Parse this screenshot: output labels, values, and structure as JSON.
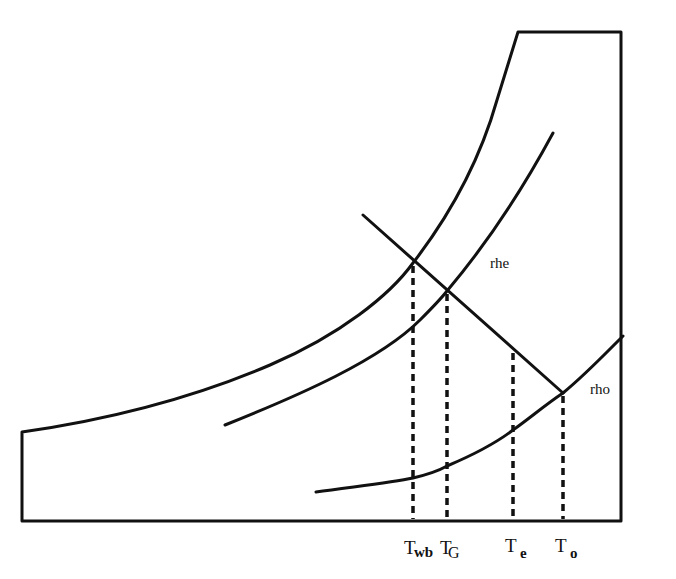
{
  "diagram": {
    "type": "psychrometric-sketch",
    "stroke_color": "#111111",
    "background": "#ffffff",
    "curve_labels": {
      "rhe": "rhe",
      "rho": "rho"
    },
    "axis_labels": [
      {
        "main": "T",
        "sub": "wb",
        "x": 413
      },
      {
        "main": "T",
        "sub": "G",
        "x": 447
      },
      {
        "main": "T",
        "sub": "e",
        "x": 513
      },
      {
        "main": "T",
        "sub": "o",
        "x": 563
      }
    ]
  }
}
